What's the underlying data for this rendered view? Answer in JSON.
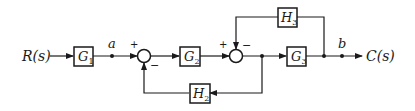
{
  "diagram": {
    "type": "control-system-block-diagram",
    "input": {
      "label": "R(s)"
    },
    "output": {
      "label": "C(s)"
    },
    "blocks": [
      {
        "id": "G1",
        "main": "G",
        "sub": "1"
      },
      {
        "id": "G2",
        "main": "G",
        "sub": "2"
      },
      {
        "id": "G3",
        "main": "G",
        "sub": "3"
      },
      {
        "id": "H2",
        "main": "H",
        "sub": "2"
      },
      {
        "id": "H3",
        "main": "H",
        "sub": "3"
      }
    ],
    "nodes": [
      {
        "id": "a",
        "label": "a"
      },
      {
        "id": "b",
        "label": "b"
      }
    ],
    "summing_junctions": [
      {
        "id": "sum1",
        "signs": {
          "forward": "+",
          "feedback": "−"
        }
      },
      {
        "id": "sum2",
        "signs": {
          "forward": "+",
          "feedback": "−"
        }
      }
    ],
    "connections": [
      "R(s) -> G1",
      "G1 -> a",
      "a -> sum1(+)",
      "sum1 -> G2",
      "G2 -> sum2(+)",
      "sum2 -> G3",
      "G3 -> b",
      "b -> C(s)",
      "sum2-output -> H2 -> sum1(−)",
      "G3-output -> H3 -> sum2(−)"
    ]
  }
}
